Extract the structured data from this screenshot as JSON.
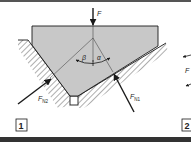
{
  "figure": {
    "panels": [
      {
        "number": "1"
      },
      {
        "number": "2"
      }
    ],
    "labels": {
      "force": "F",
      "normal_force_1": "F",
      "normal_force_1_sub": "N1",
      "normal_force_2": "F",
      "normal_force_2_sub": "N2",
      "angle_alpha": "α",
      "angle_beta": "β",
      "panel2_force": "F"
    },
    "colors": {
      "body_fill": "#c8c8c8",
      "line": "#1a1a1a",
      "border": "#333333",
      "background": "#ffffff"
    }
  }
}
